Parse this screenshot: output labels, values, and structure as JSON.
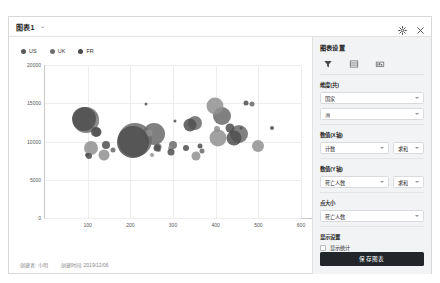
{
  "window": {
    "title": "图表1",
    "caret": "⌄",
    "gear_icon": "gear-icon",
    "close_icon": "close-icon"
  },
  "legend": {
    "items": [
      {
        "label": "US",
        "color": "#5b5b5b"
      },
      {
        "label": "UK",
        "color": "#6e6e6e"
      },
      {
        "label": "FR",
        "color": "#4a4a4a"
      }
    ]
  },
  "footer": {
    "author_text": "创建者: 小明",
    "created_text": "创建时间: 2019/12/06"
  },
  "panel": {
    "title": "图表设置",
    "tabs": [
      {
        "name": "filter-tab",
        "icon": "funnel-icon",
        "active": true
      },
      {
        "name": "table-tab",
        "icon": "table-icon",
        "active": false
      },
      {
        "name": "style-tab",
        "icon": "chart-style-icon",
        "active": false
      }
    ],
    "dimension": {
      "label": "维度(共)",
      "select_1": "国家",
      "select_2": "洲"
    },
    "x_axis": {
      "label": "数值(X轴)",
      "field": "计数",
      "aggregate": "求和"
    },
    "y_axis": {
      "label": "数值(Y轴)",
      "field": "死亡人数",
      "aggregate": "求和"
    },
    "point_size": {
      "label": "点大小",
      "field": "死亡人数"
    },
    "display": {
      "label": "显示设置",
      "checkbox_label": "显示统计",
      "checked": false
    },
    "save_button": "保存图表"
  },
  "chart_data": {
    "type": "scatter",
    "title": "",
    "xlabel": "",
    "ylabel": "",
    "xlim": [
      0,
      600
    ],
    "ylim": [
      0,
      20000
    ],
    "grid": true,
    "legend_position": "top-left",
    "xticks": [
      100,
      200,
      300,
      400,
      500,
      600
    ],
    "yticks": [
      0,
      5000,
      10000,
      15000,
      20000
    ],
    "series": [
      {
        "name": "US",
        "color": "#6a6a6a",
        "points": [
          {
            "x": 95,
            "y": 12800,
            "size": 26
          },
          {
            "x": 212,
            "y": 10200,
            "size": 34
          },
          {
            "x": 255,
            "y": 11000,
            "size": 22
          },
          {
            "x": 352,
            "y": 12400,
            "size": 14
          },
          {
            "x": 415,
            "y": 13300,
            "size": 18
          },
          {
            "x": 455,
            "y": 11000,
            "size": 18
          },
          {
            "x": 122,
            "y": 11200,
            "size": 9
          },
          {
            "x": 265,
            "y": 9300,
            "size": 7
          },
          {
            "x": 300,
            "y": 9600,
            "size": 8
          },
          {
            "x": 160,
            "y": 8900,
            "size": 5
          },
          {
            "x": 368,
            "y": 8700,
            "size": 5
          },
          {
            "x": 485,
            "y": 14900,
            "size": 5
          }
        ]
      },
      {
        "name": "UK",
        "color": "#909090",
        "points": [
          {
            "x": 115,
            "y": 12500,
            "size": 10
          },
          {
            "x": 398,
            "y": 14700,
            "size": 17
          },
          {
            "x": 405,
            "y": 10400,
            "size": 17
          },
          {
            "x": 243,
            "y": 11100,
            "size": 7
          },
          {
            "x": 500,
            "y": 9400,
            "size": 12
          },
          {
            "x": 108,
            "y": 9200,
            "size": 14
          },
          {
            "x": 138,
            "y": 8200,
            "size": 11
          },
          {
            "x": 355,
            "y": 8100,
            "size": 9
          },
          {
            "x": 404,
            "y": 11600,
            "size": 6
          },
          {
            "x": 268,
            "y": 8900,
            "size": 4
          },
          {
            "x": 250,
            "y": 8200,
            "size": 4
          },
          {
            "x": 292,
            "y": 9200,
            "size": 4
          }
        ]
      },
      {
        "name": "FR",
        "color": "#4f4f4f",
        "points": [
          {
            "x": 92,
            "y": 12900,
            "size": 24
          },
          {
            "x": 120,
            "y": 11300,
            "size": 10
          },
          {
            "x": 207,
            "y": 10000,
            "size": 32
          },
          {
            "x": 340,
            "y": 12200,
            "size": 13
          },
          {
            "x": 433,
            "y": 11800,
            "size": 9
          },
          {
            "x": 442,
            "y": 10500,
            "size": 15
          },
          {
            "x": 142,
            "y": 9500,
            "size": 8
          },
          {
            "x": 262,
            "y": 9100,
            "size": 7
          },
          {
            "x": 296,
            "y": 8600,
            "size": 7
          },
          {
            "x": 330,
            "y": 9100,
            "size": 6
          },
          {
            "x": 103,
            "y": 8100,
            "size": 6
          },
          {
            "x": 98,
            "y": 8200,
            "size": 4
          },
          {
            "x": 472,
            "y": 15000,
            "size": 5
          },
          {
            "x": 236,
            "y": 14900,
            "size": 3
          },
          {
            "x": 304,
            "y": 12700,
            "size": 3
          },
          {
            "x": 460,
            "y": 11700,
            "size": 3
          },
          {
            "x": 532,
            "y": 11700,
            "size": 4
          },
          {
            "x": 364,
            "y": 9400,
            "size": 5
          }
        ]
      }
    ]
  }
}
